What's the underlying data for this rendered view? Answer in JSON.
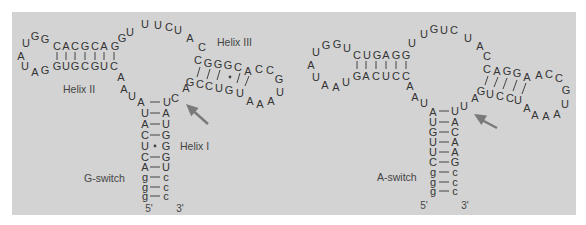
{
  "colors": {
    "panel": "#d3d3d3",
    "text": "#333333",
    "arrow": "#7a7a7a",
    "line": "#444444"
  },
  "structures": [
    {
      "name": "G-switch",
      "label": {
        "text": "G-switch",
        "x": 84,
        "y": 178
      },
      "helix_labels": [
        {
          "text": "Helix II",
          "x": 63,
          "y": 89
        },
        {
          "text": "Helix III",
          "x": 217,
          "y": 42
        },
        {
          "text": "Helix I",
          "x": 180,
          "y": 146
        }
      ],
      "ends": [
        {
          "text": "5'",
          "x": 149,
          "y": 208
        },
        {
          "text": "3'",
          "x": 180,
          "y": 208
        }
      ],
      "nucleotides": [
        {
          "c": "U",
          "x": 26,
          "y": 43
        },
        {
          "c": "G",
          "x": 35,
          "y": 36
        },
        {
          "c": "G",
          "x": 45,
          "y": 39
        },
        {
          "c": "C",
          "x": 57,
          "y": 46
        },
        {
          "c": "A",
          "x": 66,
          "y": 46
        },
        {
          "c": "C",
          "x": 75,
          "y": 46
        },
        {
          "c": "G",
          "x": 85,
          "y": 46
        },
        {
          "c": "C",
          "x": 95,
          "y": 46
        },
        {
          "c": "A",
          "x": 104,
          "y": 46
        },
        {
          "c": "G",
          "x": 115,
          "y": 46
        },
        {
          "c": "A",
          "x": 21,
          "y": 56
        },
        {
          "c": "U",
          "x": 25,
          "y": 66
        },
        {
          "c": "A",
          "x": 35,
          "y": 72
        },
        {
          "c": "G",
          "x": 45,
          "y": 70
        },
        {
          "c": "G",
          "x": 57,
          "y": 66
        },
        {
          "c": "U",
          "x": 66,
          "y": 66
        },
        {
          "c": "G",
          "x": 75,
          "y": 66
        },
        {
          "c": "C",
          "x": 85,
          "y": 66
        },
        {
          "c": "G",
          "x": 95,
          "y": 66
        },
        {
          "c": "U",
          "x": 104,
          "y": 66
        },
        {
          "c": "C",
          "x": 114,
          "y": 66
        },
        {
          "c": "G",
          "x": 122,
          "y": 38
        },
        {
          "c": "U",
          "x": 130,
          "y": 32
        },
        {
          "c": "U",
          "x": 145,
          "y": 24
        },
        {
          "c": "U",
          "x": 158,
          "y": 25
        },
        {
          "c": "C",
          "x": 169,
          "y": 27
        },
        {
          "c": "U",
          "x": 178,
          "y": 30
        },
        {
          "c": "A",
          "x": 190,
          "y": 38
        },
        {
          "c": "C",
          "x": 202,
          "y": 47
        },
        {
          "c": "C",
          "x": 198,
          "y": 60
        },
        {
          "c": "G",
          "x": 208,
          "y": 63
        },
        {
          "c": "G",
          "x": 218,
          "y": 64
        },
        {
          "c": "G",
          "x": 228,
          "y": 65
        },
        {
          "c": "C",
          "x": 238,
          "y": 67
        },
        {
          "c": "A",
          "x": 248,
          "y": 71
        },
        {
          "c": "C",
          "x": 259,
          "y": 69
        },
        {
          "c": "C",
          "x": 270,
          "y": 70
        },
        {
          "c": "G",
          "x": 279,
          "y": 79
        },
        {
          "c": "U",
          "x": 280,
          "y": 92
        },
        {
          "c": "A",
          "x": 271,
          "y": 101
        },
        {
          "c": "A",
          "x": 260,
          "y": 104
        },
        {
          "c": "A",
          "x": 250,
          "y": 101
        },
        {
          "c": "U",
          "x": 240,
          "y": 93
        },
        {
          "c": "G",
          "x": 229,
          "y": 90
        },
        {
          "c": "U",
          "x": 219,
          "y": 88
        },
        {
          "c": "C",
          "x": 209,
          "y": 86
        },
        {
          "c": "C",
          "x": 200,
          "y": 84
        },
        {
          "c": "G",
          "x": 190,
          "y": 82
        },
        {
          "c": "A",
          "x": 186,
          "y": 88
        },
        {
          "c": "A",
          "x": 121,
          "y": 77
        },
        {
          "c": "A",
          "x": 124,
          "y": 89
        },
        {
          "c": "U",
          "x": 132,
          "y": 96
        },
        {
          "c": "A",
          "x": 141,
          "y": 102
        },
        {
          "c": "U",
          "x": 167,
          "y": 102
        },
        {
          "c": "C",
          "x": 175,
          "y": 98
        },
        {
          "c": "U",
          "x": 145,
          "y": 113
        },
        {
          "c": "A",
          "x": 145,
          "y": 124
        },
        {
          "c": "C",
          "x": 145,
          "y": 135
        },
        {
          "c": "U",
          "x": 145,
          "y": 146
        },
        {
          "c": "C",
          "x": 145,
          "y": 157
        },
        {
          "c": "A",
          "x": 145,
          "y": 167
        },
        {
          "c": "g",
          "x": 145,
          "y": 177
        },
        {
          "c": "g",
          "x": 145,
          "y": 187
        },
        {
          "c": "g",
          "x": 145,
          "y": 196
        },
        {
          "c": "A",
          "x": 166,
          "y": 113
        },
        {
          "c": "U",
          "x": 166,
          "y": 124
        },
        {
          "c": "G",
          "x": 166,
          "y": 135
        },
        {
          "c": "G",
          "x": 166,
          "y": 146
        },
        {
          "c": "G",
          "x": 166,
          "y": 157
        },
        {
          "c": "U",
          "x": 166,
          "y": 167
        },
        {
          "c": "c",
          "x": 166,
          "y": 177
        },
        {
          "c": "c",
          "x": 166,
          "y": 187
        },
        {
          "c": "c",
          "x": 166,
          "y": 196
        }
      ],
      "bars_vertical": [
        [
          57,
          52,
          60
        ],
        [
          66,
          52,
          60
        ],
        [
          75,
          52,
          60
        ],
        [
          85,
          52,
          60
        ],
        [
          95,
          52,
          60
        ],
        [
          104,
          52,
          60
        ],
        [
          114,
          52,
          60
        ]
      ],
      "bars_slant": [
        [
          200,
          67,
          197,
          77
        ],
        [
          210,
          69,
          207,
          79
        ],
        [
          220,
          70,
          217,
          80
        ],
        [
          240,
          73,
          237,
          83
        ],
        [
          249,
          76,
          245,
          86
        ]
      ],
      "dots": [
        [
          230,
          77
        ],
        [
          155,
          146
        ]
      ],
      "bars_horizontal": [
        [
          150,
          160,
          102
        ],
        [
          150,
          160,
          113
        ],
        [
          150,
          160,
          124
        ],
        [
          150,
          160,
          135
        ],
        [
          150,
          160,
          157
        ],
        [
          150,
          160,
          167
        ],
        [
          150,
          160,
          177
        ],
        [
          150,
          160,
          187
        ],
        [
          150,
          160,
          196
        ]
      ],
      "arrow": {
        "x1": 208,
        "y1": 124,
        "x2": 186,
        "y2": 104
      }
    },
    {
      "name": "A-switch",
      "label": {
        "text": "A-switch",
        "x": 377,
        "y": 177
      },
      "helix_labels": [],
      "ends": [
        {
          "text": "5'",
          "x": 424,
          "y": 205
        },
        {
          "text": "3'",
          "x": 465,
          "y": 205
        }
      ],
      "nucleotides": [
        {
          "c": "U",
          "x": 316,
          "y": 52
        },
        {
          "c": "G",
          "x": 326,
          "y": 45
        },
        {
          "c": "G",
          "x": 337,
          "y": 44
        },
        {
          "c": "U",
          "x": 347,
          "y": 48
        },
        {
          "c": "C",
          "x": 357,
          "y": 55
        },
        {
          "c": "U",
          "x": 367,
          "y": 55
        },
        {
          "c": "G",
          "x": 377,
          "y": 55
        },
        {
          "c": "A",
          "x": 386,
          "y": 55
        },
        {
          "c": "G",
          "x": 396,
          "y": 55
        },
        {
          "c": "G",
          "x": 406,
          "y": 55
        },
        {
          "c": "A",
          "x": 311,
          "y": 65
        },
        {
          "c": "U",
          "x": 316,
          "y": 77
        },
        {
          "c": "A",
          "x": 325,
          "y": 85
        },
        {
          "c": "A",
          "x": 336,
          "y": 87
        },
        {
          "c": "U",
          "x": 346,
          "y": 82
        },
        {
          "c": "G",
          "x": 357,
          "y": 76
        },
        {
          "c": "A",
          "x": 366,
          "y": 76
        },
        {
          "c": "C",
          "x": 376,
          "y": 76
        },
        {
          "c": "U",
          "x": 386,
          "y": 76
        },
        {
          "c": "C",
          "x": 396,
          "y": 76
        },
        {
          "c": "C",
          "x": 406,
          "y": 76
        },
        {
          "c": "U",
          "x": 412,
          "y": 43
        },
        {
          "c": "U",
          "x": 424,
          "y": 34
        },
        {
          "c": "G",
          "x": 434,
          "y": 29
        },
        {
          "c": "U",
          "x": 444,
          "y": 30
        },
        {
          "c": "C",
          "x": 454,
          "y": 30
        },
        {
          "c": "U",
          "x": 468,
          "y": 38
        },
        {
          "c": "A",
          "x": 480,
          "y": 46
        },
        {
          "c": "C",
          "x": 487,
          "y": 56
        },
        {
          "c": "C",
          "x": 487,
          "y": 69
        },
        {
          "c": "A",
          "x": 497,
          "y": 71
        },
        {
          "c": "G",
          "x": 507,
          "y": 71
        },
        {
          "c": "G",
          "x": 517,
          "y": 73
        },
        {
          "c": "A",
          "x": 527,
          "y": 77
        },
        {
          "c": "A",
          "x": 539,
          "y": 75
        },
        {
          "c": "C",
          "x": 549,
          "y": 74
        },
        {
          "c": "C",
          "x": 559,
          "y": 78
        },
        {
          "c": "G",
          "x": 566,
          "y": 90
        },
        {
          "c": "U",
          "x": 565,
          "y": 104
        },
        {
          "c": "A",
          "x": 557,
          "y": 114
        },
        {
          "c": "A",
          "x": 546,
          "y": 116
        },
        {
          "c": "A",
          "x": 535,
          "y": 115
        },
        {
          "c": "A",
          "x": 527,
          "y": 108
        },
        {
          "c": "U",
          "x": 518,
          "y": 100
        },
        {
          "c": "C",
          "x": 510,
          "y": 98
        },
        {
          "c": "C",
          "x": 500,
          "y": 96
        },
        {
          "c": "U",
          "x": 490,
          "y": 94
        },
        {
          "c": "G",
          "x": 481,
          "y": 91
        },
        {
          "c": "A",
          "x": 475,
          "y": 98
        },
        {
          "c": "A",
          "x": 410,
          "y": 86
        },
        {
          "c": "A",
          "x": 415,
          "y": 97
        },
        {
          "c": "U",
          "x": 424,
          "y": 103
        },
        {
          "c": "A",
          "x": 433,
          "y": 112
        },
        {
          "c": "U",
          "x": 455,
          "y": 111
        },
        {
          "c": "U",
          "x": 464,
          "y": 106
        },
        {
          "c": "U",
          "x": 433,
          "y": 122
        },
        {
          "c": "G",
          "x": 433,
          "y": 132
        },
        {
          "c": "U",
          "x": 433,
          "y": 142
        },
        {
          "c": "U",
          "x": 433,
          "y": 152
        },
        {
          "c": "C",
          "x": 433,
          "y": 162
        },
        {
          "c": "g",
          "x": 433,
          "y": 172
        },
        {
          "c": "g",
          "x": 433,
          "y": 182
        },
        {
          "c": "g",
          "x": 433,
          "y": 191
        },
        {
          "c": "A",
          "x": 455,
          "y": 122
        },
        {
          "c": "C",
          "x": 455,
          "y": 132
        },
        {
          "c": "A",
          "x": 455,
          "y": 142
        },
        {
          "c": "A",
          "x": 455,
          "y": 152
        },
        {
          "c": "G",
          "x": 455,
          "y": 162
        },
        {
          "c": "c",
          "x": 455,
          "y": 172
        },
        {
          "c": "c",
          "x": 455,
          "y": 182
        },
        {
          "c": "c",
          "x": 455,
          "y": 191
        }
      ],
      "bars_vertical": [
        [
          357,
          61,
          69
        ],
        [
          366,
          61,
          69
        ],
        [
          376,
          61,
          69
        ],
        [
          386,
          61,
          69
        ],
        [
          396,
          61,
          69
        ],
        [
          406,
          61,
          69
        ]
      ],
      "bars_slant": [
        [
          488,
          76,
          485,
          85
        ],
        [
          498,
          77,
          494,
          87
        ],
        [
          507,
          78,
          503,
          89
        ],
        [
          517,
          80,
          513,
          91
        ],
        [
          526,
          83,
          522,
          94
        ]
      ],
      "dots": [],
      "bars_horizontal": [
        [
          439,
          449,
          111
        ],
        [
          439,
          449,
          122
        ],
        [
          439,
          449,
          132
        ],
        [
          439,
          449,
          142
        ],
        [
          439,
          449,
          152
        ],
        [
          439,
          449,
          162
        ],
        [
          439,
          449,
          172
        ],
        [
          439,
          449,
          182
        ],
        [
          439,
          449,
          191
        ]
      ],
      "arrow": {
        "x1": 497,
        "y1": 128,
        "x2": 474,
        "y2": 114
      }
    }
  ]
}
